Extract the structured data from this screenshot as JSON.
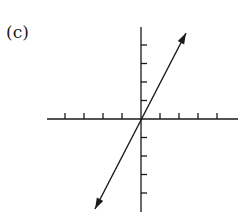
{
  "figure": {
    "label": "(c)",
    "stroke_color": "#1a1a1a",
    "axes": {
      "origin": [
        141,
        119
      ],
      "x_axis": {
        "from": 47,
        "to": 238,
        "tick_spacing": 19,
        "ticks_left": 4,
        "ticks_right": 4
      },
      "y_axis": {
        "from": 27,
        "to": 212,
        "tick_spacing": 18.5,
        "ticks_up": 4,
        "ticks_down": 4
      }
    },
    "line": {
      "description": "line through origin with positive slope, arrows at both ends",
      "start": [
        95,
        209
      ],
      "end": [
        186,
        33
      ]
    }
  }
}
